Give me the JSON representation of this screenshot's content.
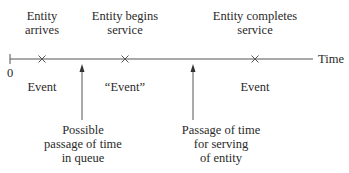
{
  "diagram": {
    "axis": {
      "label": "Time",
      "origin_label": "0"
    },
    "events": [
      {
        "top_label_lines": [
          "Entity",
          "arrives"
        ],
        "bottom_label": "Event",
        "marker": "x-mark"
      },
      {
        "top_label_lines": [
          "Entity begins",
          "service"
        ],
        "bottom_label": "“Event”",
        "marker": "x-mark"
      },
      {
        "top_label_lines": [
          "Entity completes",
          "service"
        ],
        "bottom_label": "Event",
        "marker": "x-mark"
      }
    ],
    "annotations": [
      {
        "lines": [
          "Possible",
          "passage of time",
          "in queue"
        ],
        "pointer": "up-arrow"
      },
      {
        "lines": [
          "Passage of time",
          "for serving",
          "of entity"
        ],
        "pointer": "up-arrow"
      }
    ],
    "colors": {
      "line": "#555555",
      "text": "#2a2a2a"
    }
  }
}
